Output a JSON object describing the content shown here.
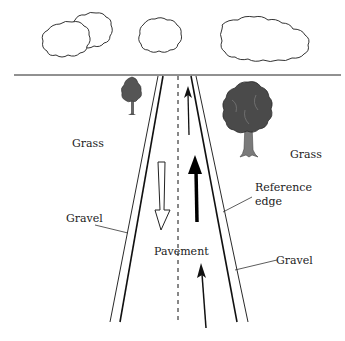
{
  "diagram": {
    "type": "road-scene-illustration",
    "colors": {
      "background": "#ffffff",
      "line": "#111111",
      "tree_foliage": "#444444",
      "tree_trunk": "#777777",
      "text": "#222222"
    },
    "labels": {
      "grass_left": "Grass",
      "grass_right": "Grass",
      "gravel_left": "Gravel",
      "gravel_right": "Gravel",
      "pavement": "Pavement",
      "reference_edge_line1": "Reference",
      "reference_edge_line2": "edge"
    },
    "elements": {
      "clouds": [
        "cloud-left-pair",
        "cloud-center",
        "cloud-right-long"
      ],
      "trees": [
        "small-tree-left",
        "large-tree-right"
      ],
      "arrows": [
        {
          "name": "thin-up-arrow-far",
          "direction": "up",
          "style": "thin-solid"
        },
        {
          "name": "thick-up-arrow",
          "direction": "up",
          "style": "bold-solid"
        },
        {
          "name": "hollow-down-arrow",
          "direction": "down",
          "style": "outline"
        },
        {
          "name": "thin-up-arrow-near",
          "direction": "up",
          "style": "thin-solid"
        }
      ]
    }
  }
}
